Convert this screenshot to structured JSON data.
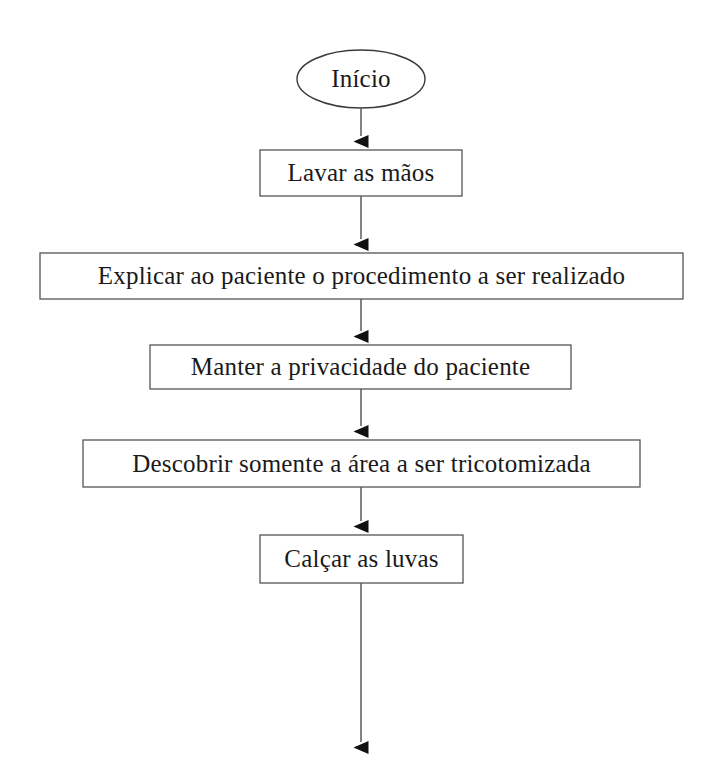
{
  "diagram": {
    "type": "flowchart",
    "orientation": "vertical",
    "style": {
      "background_color": "#ffffff",
      "stroke_color": "#3a3a3a",
      "text_color": "#1a1a1a",
      "arrow_fill": "#111111"
    },
    "nodes": [
      {
        "id": "start",
        "shape": "ellipse",
        "label": "Início",
        "x": 297,
        "y": 50,
        "width": 128,
        "height": 58
      },
      {
        "id": "step1",
        "shape": "rectangle",
        "label": "Lavar as mãos",
        "x": 260,
        "y": 150,
        "width": 202,
        "height": 46
      },
      {
        "id": "step2",
        "shape": "rectangle",
        "label": "Explicar ao paciente o procedimento a ser realizado",
        "x": 40,
        "y": 253,
        "width": 643,
        "height": 46
      },
      {
        "id": "step3",
        "shape": "rectangle",
        "label": "Manter a privacidade do paciente",
        "x": 150,
        "y": 345,
        "width": 421,
        "height": 44
      },
      {
        "id": "step4",
        "shape": "rectangle",
        "label": "Descobrir somente a área a ser tricotomizada",
        "x": 83,
        "y": 440,
        "width": 557,
        "height": 47
      },
      {
        "id": "step5",
        "shape": "rectangle",
        "label": "Calçar as luvas",
        "x": 260,
        "y": 535,
        "width": 203,
        "height": 48
      }
    ],
    "connectors": [
      {
        "id": "start-to-step1",
        "from": "start",
        "to": "step1",
        "x": 361,
        "y1": 108,
        "y2": 150,
        "arrowhead": true
      },
      {
        "id": "step1-to-step2",
        "from": "step1",
        "to": "step2",
        "x": 361,
        "y1": 196,
        "y2": 253,
        "arrowhead": true
      },
      {
        "id": "step2-to-step3",
        "from": "step2",
        "to": "step3",
        "x": 361,
        "y1": 299,
        "y2": 345,
        "arrowhead": true
      },
      {
        "id": "step3-to-step4",
        "from": "step3",
        "to": "step4",
        "x": 361,
        "y1": 389,
        "y2": 440,
        "arrowhead": true
      },
      {
        "id": "step4-to-step5",
        "from": "step4",
        "to": "step5",
        "x": 361,
        "y1": 487,
        "y2": 535,
        "arrowhead": true
      },
      {
        "id": "step5-to-continuation",
        "from": "step5",
        "to": "continuation",
        "x": 361,
        "y1": 583,
        "y2": 757,
        "arrowhead": true
      }
    ]
  }
}
